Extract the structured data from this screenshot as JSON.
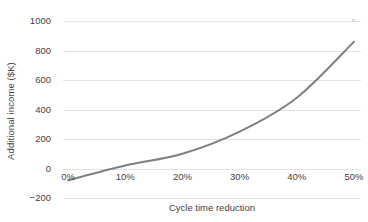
{
  "chart_data": {
    "type": "line",
    "title": "",
    "xlabel": "Cycle time reduction",
    "ylabel": "Additional income ($K)",
    "x": [
      0,
      10,
      20,
      30,
      40,
      50
    ],
    "categories": [
      "0%",
      "10%",
      "20%",
      "30%",
      "40%",
      "50%"
    ],
    "series": [
      {
        "name": "Additional income",
        "values": [
          -80,
          20,
          100,
          250,
          480,
          860
        ],
        "color": "#808080"
      }
    ],
    "xlim": [
      0,
      50
    ],
    "ylim": [
      -200,
      1000
    ],
    "y_ticks": [
      1000,
      800,
      600,
      400,
      200,
      0,
      -200
    ],
    "y_tick_labels": [
      "1000",
      "800",
      "600",
      "400",
      "200",
      "0",
      "−200"
    ],
    "x_ticks": [
      0,
      10,
      20,
      30,
      40,
      50
    ],
    "x_tick_labels": [
      "0%",
      "10%",
      "20%",
      "30%",
      "40%",
      "50%"
    ],
    "grid": true,
    "grid_axis": "y",
    "grid_color": "#e2e2e2",
    "legend": false,
    "legend_position": "none",
    "background_color": "#ffffff",
    "text_color": "#3f3f3f",
    "line_width": 2
  }
}
